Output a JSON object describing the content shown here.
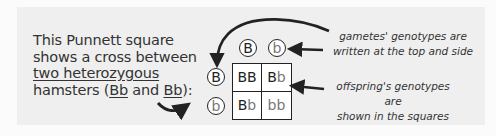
{
  "description": {
    "line1": "This Punnett square",
    "line2": "shows a cross between",
    "line3": "two heterozygous",
    "line4_pre": "hamsters (",
    "line4_p1": "Bb",
    "line4_mid": " and ",
    "line4_p2": "Bb",
    "line4_post": "):"
  },
  "annotations": {
    "gametes_line1": "gametes' genotypes are",
    "gametes_line2": "written at the top and side",
    "offspring_line1": "offspring's genotypes are",
    "offspring_line2": "shown in the squares"
  },
  "punnett": {
    "top_gametes": [
      "B",
      "b"
    ],
    "side_gametes": [
      "B",
      "b"
    ],
    "cells": [
      [
        {
          "u": "BB",
          "l": ""
        },
        {
          "u": "B",
          "l": "b"
        }
      ],
      [
        {
          "u": "B",
          "l": "b"
        },
        {
          "u": "",
          "l": "bb"
        }
      ]
    ]
  },
  "colors": {
    "panel_bg": "#efefef",
    "uppercase_allele": "#222222",
    "lowercase_allele": "#777777",
    "arrow": "#222222"
  }
}
